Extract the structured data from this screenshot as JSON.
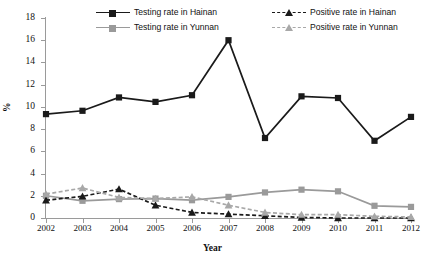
{
  "chart_data": {
    "type": "line",
    "title": "",
    "xlabel": "Year",
    "ylabel": "%",
    "x": [
      "2002",
      "2003",
      "2004",
      "2005",
      "2006",
      "2007",
      "2008",
      "2009",
      "2010",
      "2011",
      "2012"
    ],
    "categories": [
      "2002",
      "2003",
      "2004",
      "2005",
      "2006",
      "2007",
      "2008",
      "2009",
      "2010",
      "2011",
      "2012"
    ],
    "ylim": [
      0,
      18
    ],
    "yticks": [
      0,
      2,
      4,
      6,
      8,
      10,
      12,
      14,
      16,
      18
    ],
    "ytick_labels": [
      "0",
      "2",
      "4",
      "6",
      "8",
      "10",
      "12",
      "14",
      "16",
      "18"
    ],
    "grid": false,
    "legend_position": "top",
    "series": [
      {
        "name": "Testing rate in Hainan",
        "color": "#1a1a1a",
        "marker": "square",
        "line_style": "solid",
        "values": [
          9.35,
          9.65,
          10.85,
          10.45,
          11.05,
          16.0,
          7.2,
          10.95,
          10.8,
          6.95,
          9.1
        ]
      },
      {
        "name": "Testing rate in Yunnan",
        "color": "#9a9a9a",
        "marker": "square",
        "line_style": "solid",
        "values": [
          2.0,
          1.55,
          1.7,
          1.75,
          1.6,
          1.9,
          2.3,
          2.55,
          2.4,
          1.1,
          1.0
        ]
      },
      {
        "name": "Positive rate in Hainan",
        "color": "#1a1a1a",
        "marker": "triangle",
        "line_style": "dashed",
        "values": [
          1.6,
          1.95,
          2.6,
          1.15,
          0.5,
          0.35,
          0.2,
          0.05,
          0.0,
          0.0,
          0.0
        ]
      },
      {
        "name": "Positive rate in Yunnan",
        "color": "#a8a8a8",
        "marker": "triangle",
        "line_style": "dashed",
        "values": [
          2.15,
          2.7,
          1.85,
          1.75,
          1.9,
          1.15,
          0.5,
          0.3,
          0.3,
          0.15,
          0.1
        ]
      }
    ]
  },
  "legend": {
    "entries": [
      {
        "label": "Testing rate in Hainan"
      },
      {
        "label": "Testing rate in Yunnan"
      },
      {
        "label": "Positive rate in Hainan"
      },
      {
        "label": "Positive rate in Yunnan"
      }
    ]
  },
  "axes": {
    "x_title": "Year",
    "y_title": "%"
  }
}
